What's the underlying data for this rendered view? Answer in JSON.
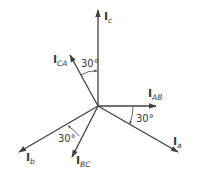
{
  "diagram": {
    "type": "phasor-diagram",
    "colors": {
      "line": "#404040",
      "text": "#3a3a3a",
      "background": "#ffffff"
    },
    "origin": [
      98,
      106
    ],
    "phasors": [
      {
        "id": "Ic",
        "main": "I",
        "sub": "c",
        "tip": [
          98,
          10
        ],
        "label_pos": [
          104,
          20
        ]
      },
      {
        "id": "ICA",
        "main": "I",
        "sub": "CA",
        "tip": [
          70,
          55
        ],
        "label_pos": [
          53,
          63
        ]
      },
      {
        "id": "IAB",
        "main": "I",
        "sub": "AB",
        "tip": [
          156,
          106
        ],
        "label_pos": [
          148,
          97
        ]
      },
      {
        "id": "Ia",
        "main": "I",
        "sub": "a",
        "tip": [
          178,
          152
        ],
        "label_pos": [
          173,
          145
        ]
      },
      {
        "id": "Ib",
        "main": "I",
        "sub": "b",
        "tip": [
          19,
          152
        ],
        "label_pos": [
          26,
          161
        ]
      },
      {
        "id": "IBC",
        "main": "I",
        "sub": "BC",
        "tip": [
          72,
          157
        ],
        "label_pos": [
          76,
          164
        ]
      }
    ],
    "angles": [
      {
        "label": "30°",
        "between": [
          "ICA",
          "Ic"
        ],
        "label_pos": [
          81,
          67
        ]
      },
      {
        "label": "30°",
        "between": [
          "IAB",
          "Ia"
        ],
        "label_pos": [
          136,
          122
        ]
      },
      {
        "label": "30°",
        "between": [
          "Ib",
          "IBC"
        ],
        "label_pos": [
          58,
          142
        ]
      }
    ]
  }
}
